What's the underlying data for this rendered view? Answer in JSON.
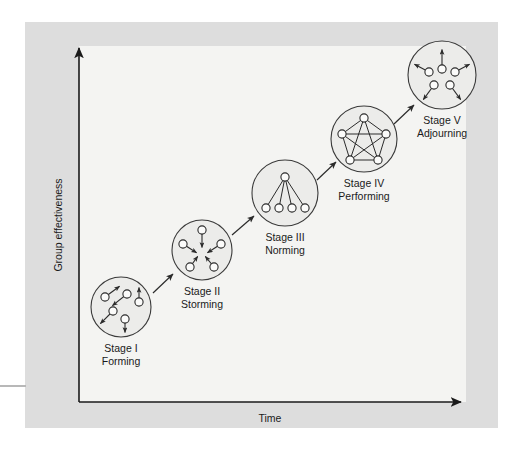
{
  "figure": {
    "background_color": "#ffffff",
    "band_color": "#dddddd",
    "plot_color": "#f4f4f2",
    "ink_color": "#1a1a1a",
    "circle_fill": "#ececea",
    "node_fill": "#fbfbfa"
  },
  "axes": {
    "y_label": "Group effectiveness",
    "x_label": "Time"
  },
  "stages": [
    {
      "id": "stage-1",
      "stage": "Stage I",
      "name": "Forming",
      "pattern": "scattered-individuals",
      "member_count": 5,
      "cx": 121,
      "cy": 307,
      "r": 30,
      "label_x": 121,
      "label_y": 352,
      "nodes": [
        {
          "x": 105,
          "y": 297
        },
        {
          "x": 127,
          "y": 294
        },
        {
          "x": 113,
          "y": 311
        },
        {
          "x": 139,
          "y": 302
        },
        {
          "x": 125,
          "y": 319
        }
      ],
      "arrows": [
        {
          "x1": 105,
          "y1": 297,
          "x2": 120,
          "y2": 286
        },
        {
          "x1": 127,
          "y1": 294,
          "x2": 112,
          "y2": 306
        },
        {
          "x1": 113,
          "y1": 311,
          "x2": 100,
          "y2": 324
        },
        {
          "x1": 139,
          "y1": 302,
          "x2": 139,
          "y2": 287
        },
        {
          "x1": 125,
          "y1": 319,
          "x2": 125,
          "y2": 333
        }
      ]
    },
    {
      "id": "stage-2",
      "stage": "Stage II",
      "name": "Storming",
      "pattern": "conflict-inward",
      "member_count": 5,
      "cx": 202,
      "cy": 250,
      "r": 30,
      "label_x": 202,
      "label_y": 295,
      "nodes": [
        {
          "x": 202,
          "y": 230
        },
        {
          "x": 221,
          "y": 244
        },
        {
          "x": 214,
          "y": 267
        },
        {
          "x": 190,
          "y": 267
        },
        {
          "x": 183,
          "y": 244
        }
      ],
      "arrows": [
        {
          "x1": 202,
          "y1": 230,
          "x2": 202,
          "y2": 248
        },
        {
          "x1": 221,
          "y1": 244,
          "x2": 207,
          "y2": 253
        },
        {
          "x1": 214,
          "y1": 267,
          "x2": 205,
          "y2": 256
        },
        {
          "x1": 190,
          "y1": 267,
          "x2": 198,
          "y2": 256
        },
        {
          "x1": 183,
          "y1": 244,
          "x2": 197,
          "y2": 253
        }
      ]
    },
    {
      "id": "stage-3",
      "stage": "Stage III",
      "name": "Norming",
      "pattern": "hierarchy-tree",
      "member_count": 5,
      "cx": 285,
      "cy": 193,
      "r": 33,
      "label_x": 285,
      "label_y": 241,
      "nodes": [
        {
          "x": 285,
          "y": 177
        },
        {
          "x": 266,
          "y": 208
        },
        {
          "x": 279,
          "y": 208
        },
        {
          "x": 292,
          "y": 208
        },
        {
          "x": 305,
          "y": 208
        }
      ],
      "arrows": [],
      "links": [
        {
          "x1": 285,
          "y1": 177,
          "x2": 266,
          "y2": 208
        },
        {
          "x1": 285,
          "y1": 177,
          "x2": 279,
          "y2": 208
        },
        {
          "x1": 285,
          "y1": 177,
          "x2": 292,
          "y2": 208
        },
        {
          "x1": 285,
          "y1": 177,
          "x2": 305,
          "y2": 208
        }
      ]
    },
    {
      "id": "stage-4",
      "stage": "Stage IV",
      "name": "Performing",
      "pattern": "fully-connected",
      "member_count": 5,
      "cx": 364,
      "cy": 139,
      "r": 33,
      "label_x": 364,
      "label_y": 187,
      "nodes": [
        {
          "x": 364,
          "y": 118
        },
        {
          "x": 386,
          "y": 134
        },
        {
          "x": 378,
          "y": 160
        },
        {
          "x": 350,
          "y": 160
        },
        {
          "x": 342,
          "y": 134
        }
      ],
      "arrows": [],
      "links": [
        {
          "x1": 364,
          "y1": 118,
          "x2": 386,
          "y2": 134
        },
        {
          "x1": 386,
          "y1": 134,
          "x2": 378,
          "y2": 160
        },
        {
          "x1": 378,
          "y1": 160,
          "x2": 350,
          "y2": 160
        },
        {
          "x1": 350,
          "y1": 160,
          "x2": 342,
          "y2": 134
        },
        {
          "x1": 342,
          "y1": 134,
          "x2": 364,
          "y2": 118
        },
        {
          "x1": 364,
          "y1": 118,
          "x2": 378,
          "y2": 160
        },
        {
          "x1": 364,
          "y1": 118,
          "x2": 350,
          "y2": 160
        },
        {
          "x1": 386,
          "y1": 134,
          "x2": 350,
          "y2": 160
        },
        {
          "x1": 386,
          "y1": 134,
          "x2": 342,
          "y2": 134
        },
        {
          "x1": 378,
          "y1": 160,
          "x2": 342,
          "y2": 134
        }
      ]
    },
    {
      "id": "stage-5",
      "stage": "Stage V",
      "name": "Adjourning",
      "pattern": "dispersing-outward",
      "member_count": 5,
      "cx": 442,
      "cy": 75,
      "r": 34,
      "label_x": 442,
      "label_y": 124,
      "nodes": [
        {
          "x": 442,
          "y": 69
        },
        {
          "x": 429,
          "y": 72
        },
        {
          "x": 455,
          "y": 72
        },
        {
          "x": 434,
          "y": 85
        },
        {
          "x": 450,
          "y": 85
        }
      ],
      "arrows": [
        {
          "x1": 442,
          "y1": 69,
          "x2": 442,
          "y2": 49
        },
        {
          "x1": 429,
          "y1": 72,
          "x2": 414,
          "y2": 64
        },
        {
          "x1": 455,
          "y1": 72,
          "x2": 470,
          "y2": 64
        },
        {
          "x1": 434,
          "y1": 85,
          "x2": 423,
          "y2": 100
        },
        {
          "x1": 450,
          "y1": 85,
          "x2": 461,
          "y2": 100
        }
      ]
    }
  ],
  "flow_arrows": [
    {
      "from": "stage-1",
      "to": "stage-2",
      "x1": 153,
      "y1": 293,
      "x2": 173,
      "y2": 274
    },
    {
      "from": "stage-2",
      "to": "stage-3",
      "x1": 232,
      "y1": 235,
      "x2": 254,
      "y2": 216
    },
    {
      "from": "stage-3",
      "to": "stage-4",
      "x1": 317,
      "y1": 180,
      "x2": 336,
      "y2": 162
    },
    {
      "from": "stage-4",
      "to": "stage-5",
      "x1": 394,
      "y1": 124,
      "x2": 414,
      "y2": 105
    }
  ]
}
